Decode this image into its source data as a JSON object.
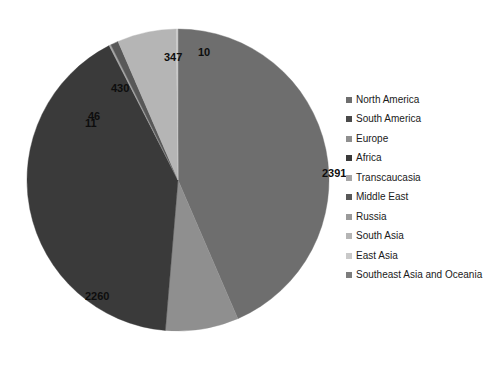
{
  "chart_data": {
    "type": "pie",
    "title": "",
    "subtitle": "",
    "xlabel": "",
    "ylabel": "",
    "grid": false,
    "legend_position": "right",
    "start_angle_deg": 0,
    "direction": "clockwise",
    "categories": [
      "North America",
      "South America",
      "Europe",
      "Africa",
      "Transcaucasia",
      "Middle East",
      "Russia",
      "South Asia",
      "East Asia",
      "Southeast Asia and Oceania"
    ],
    "values": [
      2391,
      0,
      430,
      2260,
      11,
      46,
      0,
      347,
      10,
      0
    ],
    "visible_labels": [
      "2391",
      "2260",
      "430",
      "347",
      "46",
      "11",
      "10"
    ],
    "colors": [
      "#6e6e6e",
      "#4a4a4a",
      "#8f8f8f",
      "#3a3a3a",
      "#a5a5a5",
      "#585858",
      "#9a9a9a",
      "#b5b5b5",
      "#c9c9c9",
      "#7d7d7d"
    ],
    "total": 5495
  },
  "pie": {
    "center_x": 152,
    "center_y": 166,
    "radius": 151,
    "labels": [
      {
        "text": "10",
        "x": 172,
        "y": 33
      },
      {
        "text": "2391",
        "x": 296,
        "y": 154
      },
      {
        "text": "2260",
        "x": 59,
        "y": 277
      },
      {
        "text": "46",
        "x": 62,
        "y": 97
      },
      {
        "text": "11",
        "x": 59,
        "y": 104
      },
      {
        "text": "430",
        "x": 85,
        "y": 69
      },
      {
        "text": "347",
        "x": 138,
        "y": 38
      }
    ]
  },
  "legend": {
    "items": [
      {
        "label": "North America",
        "color": "#6e6e6e"
      },
      {
        "label": "South America",
        "color": "#4a4a4a"
      },
      {
        "label": "Europe",
        "color": "#8f8f8f"
      },
      {
        "label": "Africa",
        "color": "#3a3a3a"
      },
      {
        "label": "Transcaucasia",
        "color": "#a5a5a5"
      },
      {
        "label": "Middle East",
        "color": "#585858"
      },
      {
        "label": "Russia",
        "color": "#9a9a9a"
      },
      {
        "label": "South Asia",
        "color": "#b5b5b5"
      },
      {
        "label": "East Asia",
        "color": "#c9c9c9"
      },
      {
        "label": "Southeast Asia and Oceania",
        "color": "#7d7d7d"
      }
    ]
  }
}
